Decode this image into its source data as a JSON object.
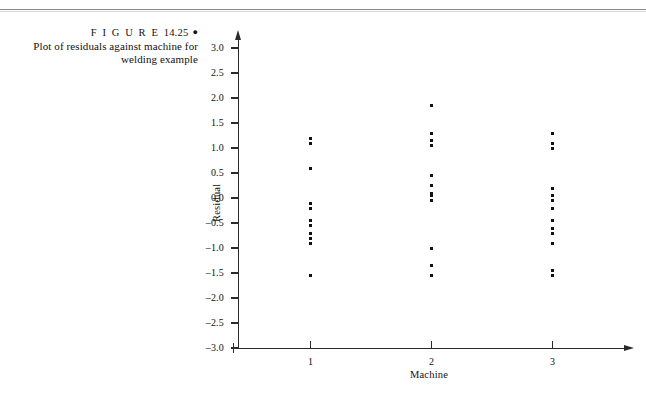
{
  "page": {
    "running_head": "",
    "rule_color": "#8b8b8b"
  },
  "caption": {
    "figure_word": "F I G U R E",
    "figure_number": "14.25",
    "bullet": "●",
    "line1": "Plot of residuals against machine for",
    "line2": "welding example"
  },
  "chart_data": {
    "type": "scatter",
    "title": "Plot of residuals against machine for welding example",
    "xlabel": "Machine",
    "ylabel": "Residual",
    "grid": false,
    "legend": null,
    "xlim": [
      0.35,
      3.6
    ],
    "ylim": [
      -3.0,
      3.0
    ],
    "xticks": [
      1,
      2,
      3
    ],
    "xtick_labels": [
      "1",
      "2",
      "3"
    ],
    "yticks": [
      3.0,
      2.5,
      2.0,
      1.5,
      1.0,
      0.5,
      0.0,
      -0.5,
      -1.0,
      -1.5,
      -2.0,
      -2.5,
      -3.0
    ],
    "ytick_labels": [
      "3.0",
      "2.5",
      "2.0",
      "1.5",
      "1.0",
      "0.5",
      "0.0",
      "–0.5",
      "–1.0",
      "–1.5",
      "–2.0",
      "–2.5",
      "–3.0"
    ],
    "axis_color": "#2a2a2a",
    "marker_color": "#121212",
    "marker_size_px": 3,
    "series": [
      {
        "name": "Machine 1",
        "x": 1,
        "values": [
          1.2,
          1.1,
          0.6,
          -0.1,
          -0.2,
          -0.45,
          -0.55,
          -0.7,
          -0.8,
          -0.9,
          -1.55
        ]
      },
      {
        "name": "Machine 2",
        "x": 2,
        "values": [
          1.85,
          1.3,
          1.15,
          1.05,
          0.45,
          0.25,
          0.1,
          0.05,
          -0.05,
          -1.0,
          -1.35,
          -1.55
        ]
      },
      {
        "name": "Machine 3",
        "x": 3,
        "values": [
          1.3,
          1.1,
          1.0,
          0.2,
          0.05,
          -0.05,
          -0.2,
          -0.45,
          -0.6,
          -0.7,
          -0.9,
          -1.45,
          -1.55
        ]
      }
    ]
  }
}
